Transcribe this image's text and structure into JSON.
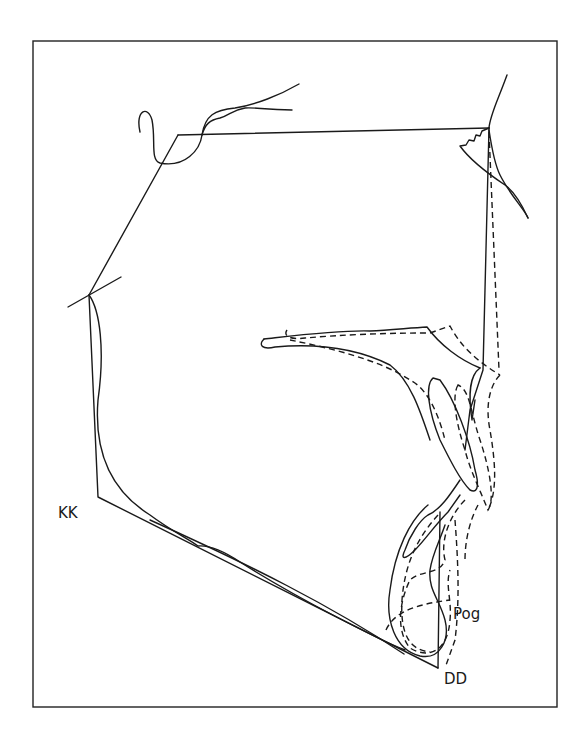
{
  "diagram": {
    "type": "cephalometric-superimposition-tracing",
    "labels": {
      "kk": "KK",
      "pog": "Pog",
      "dd": "DD"
    },
    "legend_styles": {
      "solid": "pre-treatment tracing",
      "dashed": "post-treatment tracing"
    },
    "colors": {
      "line": "#1a1a1a",
      "background": "#ffffff"
    }
  }
}
